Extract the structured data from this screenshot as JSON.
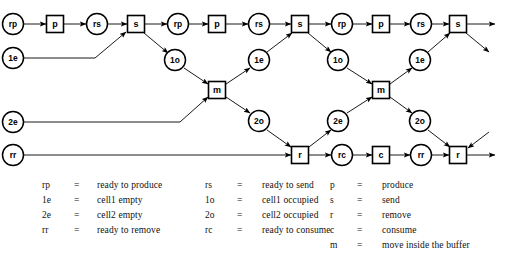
{
  "diagram": {
    "type": "petri-net-unfolding",
    "title": "",
    "node_shapes": {
      "circle": "condition",
      "square": "event"
    },
    "nodes": [
      {
        "id": "n1",
        "label": "rp",
        "shape": "circle",
        "x": 13,
        "y": 24
      },
      {
        "id": "n2",
        "label": "p",
        "shape": "square",
        "x": 55,
        "y": 24
      },
      {
        "id": "n3",
        "label": "rs",
        "shape": "circle",
        "x": 97,
        "y": 24
      },
      {
        "id": "n4",
        "label": "s",
        "shape": "square",
        "x": 136,
        "y": 24
      },
      {
        "id": "n5",
        "label": "rp",
        "shape": "circle",
        "x": 178,
        "y": 24
      },
      {
        "id": "n6",
        "label": "p",
        "shape": "square",
        "x": 217,
        "y": 24
      },
      {
        "id": "n7",
        "label": "rs",
        "shape": "circle",
        "x": 259,
        "y": 24
      },
      {
        "id": "n8",
        "label": "s",
        "shape": "square",
        "x": 300,
        "y": 24
      },
      {
        "id": "n9",
        "label": "rp",
        "shape": "circle",
        "x": 342,
        "y": 24
      },
      {
        "id": "n10",
        "label": "p",
        "shape": "square",
        "x": 381,
        "y": 24
      },
      {
        "id": "n11",
        "label": "rs",
        "shape": "circle",
        "x": 421,
        "y": 24
      },
      {
        "id": "n12",
        "label": "s",
        "shape": "square",
        "x": 458,
        "y": 24
      },
      {
        "id": "c1",
        "label": "1e",
        "shape": "circle",
        "x": 13,
        "y": 58
      },
      {
        "id": "c2",
        "label": "1o",
        "shape": "circle",
        "x": 175,
        "y": 60
      },
      {
        "id": "c3",
        "label": "1e",
        "shape": "circle",
        "x": 259,
        "y": 60
      },
      {
        "id": "c4",
        "label": "1o",
        "shape": "circle",
        "x": 338,
        "y": 60
      },
      {
        "id": "c5",
        "label": "1e",
        "shape": "circle",
        "x": 420,
        "y": 60
      },
      {
        "id": "m1",
        "label": "m",
        "shape": "square",
        "x": 217,
        "y": 90
      },
      {
        "id": "m2",
        "label": "m",
        "shape": "square",
        "x": 381,
        "y": 90
      },
      {
        "id": "d1",
        "label": "2e",
        "shape": "circle",
        "x": 13,
        "y": 122
      },
      {
        "id": "d2",
        "label": "2o",
        "shape": "circle",
        "x": 259,
        "y": 121
      },
      {
        "id": "d3",
        "label": "2e",
        "shape": "circle",
        "x": 338,
        "y": 121
      },
      {
        "id": "d4",
        "label": "2o",
        "shape": "circle",
        "x": 420,
        "y": 121
      },
      {
        "id": "r1",
        "label": "rr",
        "shape": "circle",
        "x": 13,
        "y": 155
      },
      {
        "id": "r2",
        "label": "r",
        "shape": "square",
        "x": 300,
        "y": 155
      },
      {
        "id": "r3",
        "label": "rc",
        "shape": "circle",
        "x": 342,
        "y": 155
      },
      {
        "id": "r4",
        "label": "c",
        "shape": "square",
        "x": 381,
        "y": 155
      },
      {
        "id": "r5",
        "label": "rr",
        "shape": "circle",
        "x": 421,
        "y": 155
      },
      {
        "id": "r6",
        "label": "r",
        "shape": "square",
        "x": 458,
        "y": 155
      }
    ],
    "edges": [
      {
        "from": "n1",
        "to": "n2"
      },
      {
        "from": "n2",
        "to": "n3"
      },
      {
        "from": "n3",
        "to": "n4"
      },
      {
        "from": "n4",
        "to": "n5"
      },
      {
        "from": "n5",
        "to": "n6"
      },
      {
        "from": "n6",
        "to": "n7"
      },
      {
        "from": "n7",
        "to": "n8"
      },
      {
        "from": "n8",
        "to": "n9"
      },
      {
        "from": "n9",
        "to": "n10"
      },
      {
        "from": "n10",
        "to": "n11"
      },
      {
        "from": "n11",
        "to": "n12"
      },
      {
        "from": "n12",
        "to": "out-top"
      },
      {
        "from": "c1",
        "to": "n4"
      },
      {
        "from": "n4",
        "to": "c2"
      },
      {
        "from": "c2",
        "to": "m1"
      },
      {
        "from": "m1",
        "to": "c3"
      },
      {
        "from": "c3",
        "to": "n8"
      },
      {
        "from": "n8",
        "to": "c4"
      },
      {
        "from": "c4",
        "to": "m2"
      },
      {
        "from": "m2",
        "to": "c5"
      },
      {
        "from": "c5",
        "to": "n12"
      },
      {
        "from": "n12",
        "to": "out-1o"
      },
      {
        "from": "d1",
        "to": "m1"
      },
      {
        "from": "m1",
        "to": "d2"
      },
      {
        "from": "d2",
        "to": "r2"
      },
      {
        "from": "r2",
        "to": "d3"
      },
      {
        "from": "d3",
        "to": "m2"
      },
      {
        "from": "m2",
        "to": "d4"
      },
      {
        "from": "d4",
        "to": "r6"
      },
      {
        "from": "in-2e",
        "to": "r6"
      },
      {
        "from": "r1",
        "to": "r2"
      },
      {
        "from": "r2",
        "to": "r3"
      },
      {
        "from": "r3",
        "to": "r4"
      },
      {
        "from": "r4",
        "to": "r5"
      },
      {
        "from": "r5",
        "to": "r6"
      },
      {
        "from": "r6",
        "to": "out-bot"
      }
    ]
  },
  "legend": {
    "columns": [
      {
        "entries": [
          {
            "symbol": "rp",
            "eq": "=",
            "definition": "ready to produce"
          },
          {
            "symbol": "1e",
            "eq": "=",
            "definition": "cell1 empty"
          },
          {
            "symbol": "2e",
            "eq": "=",
            "definition": "cell2 empty"
          },
          {
            "symbol": "rr",
            "eq": "=",
            "definition": "ready to remove"
          }
        ]
      },
      {
        "entries": [
          {
            "symbol": "rs",
            "eq": "=",
            "definition": "ready to send"
          },
          {
            "symbol": "1o",
            "eq": "=",
            "definition": "cell1 occupied"
          },
          {
            "symbol": "2o",
            "eq": "=",
            "definition": "cell2 occupied"
          },
          {
            "symbol": "rc",
            "eq": "=",
            "definition": "ready to consume"
          }
        ]
      },
      {
        "entries": [
          {
            "symbol": "p",
            "eq": "=",
            "definition": "produce"
          },
          {
            "symbol": "s",
            "eq": "=",
            "definition": "send"
          },
          {
            "symbol": "r",
            "eq": "=",
            "definition": "remove"
          },
          {
            "symbol": "c",
            "eq": "=",
            "definition": "consume"
          },
          {
            "symbol": "m",
            "eq": "=",
            "definition": "move inside the buffer"
          }
        ]
      }
    ]
  },
  "colors": {
    "stroke": "#000000",
    "background": "#ffffff",
    "text": "#000000"
  }
}
